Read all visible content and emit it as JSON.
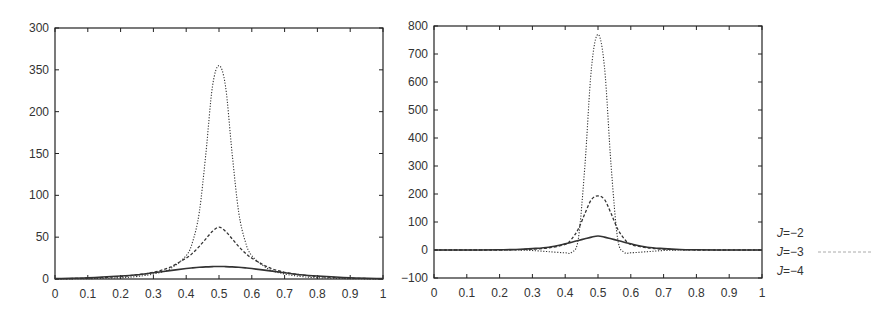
{
  "chart_data": [
    {
      "type": "line",
      "title": "",
      "xlabel": "",
      "ylabel": "",
      "xlim": [
        0,
        1
      ],
      "ylim": [
        0,
        300
      ],
      "grid": false,
      "x_ticks": [
        "0",
        "0.1",
        "0.2",
        "0.3",
        "0.4",
        "0.5",
        "0.6",
        "0.7",
        "0.8",
        "0.9",
        "1"
      ],
      "y_ticks": [
        "0",
        "50",
        "100",
        "150",
        "200",
        "350",
        "300"
      ],
      "x": [
        0,
        0.1,
        0.2,
        0.25,
        0.3,
        0.35,
        0.4,
        0.42,
        0.44,
        0.46,
        0.48,
        0.5,
        0.52,
        0.54,
        0.56,
        0.58,
        0.6,
        0.65,
        0.7,
        0.75,
        0.8,
        0.9,
        1
      ],
      "series": [
        {
          "name": "J=-2",
          "style": "solid",
          "values": [
            0.5,
            1.5,
            3.5,
            5,
            7.5,
            10,
            12.5,
            13.3,
            14,
            14.5,
            14.8,
            15,
            14.8,
            14.5,
            14,
            13.3,
            12.5,
            10,
            7.5,
            5,
            3.5,
            1.5,
            0.5
          ]
        },
        {
          "name": "J=-3",
          "style": "dashed",
          "values": [
            0.3,
            1,
            3,
            5,
            8,
            14,
            25,
            31,
            39,
            48,
            57,
            62,
            57,
            48,
            39,
            31,
            25,
            14,
            8,
            5,
            3,
            1,
            0.3
          ]
        },
        {
          "name": "J=-4",
          "style": "dotted",
          "values": [
            0.1,
            0.4,
            1.5,
            3,
            6,
            12,
            28,
            45,
            80,
            150,
            230,
            255,
            230,
            150,
            80,
            45,
            28,
            12,
            6,
            3,
            1.5,
            0.4,
            0.1
          ]
        }
      ]
    },
    {
      "type": "line",
      "title": "",
      "xlabel": "",
      "ylabel": "",
      "xlim": [
        0,
        1
      ],
      "ylim": [
        -100,
        800
      ],
      "grid": false,
      "x_ticks": [
        "0",
        "0.1",
        "0.2",
        "0.3",
        "0.4",
        "0.5",
        "0.6",
        "0.7",
        "0.8",
        "0.9",
        "1"
      ],
      "y_ticks": [
        "-100",
        "0",
        "100",
        "200",
        "300",
        "400",
        "500",
        "600",
        "700",
        "800"
      ],
      "x": [
        0,
        0.1,
        0.2,
        0.25,
        0.3,
        0.35,
        0.4,
        0.42,
        0.44,
        0.46,
        0.48,
        0.5,
        0.52,
        0.54,
        0.56,
        0.58,
        0.6,
        0.65,
        0.7,
        0.75,
        0.8,
        0.9,
        1
      ],
      "series": [
        {
          "name": "J=-2",
          "style": "solid",
          "values": [
            0,
            0,
            1,
            2,
            5,
            10,
            22,
            28,
            34,
            40,
            46,
            50,
            46,
            40,
            34,
            28,
            22,
            10,
            5,
            2,
            1,
            0,
            0
          ]
        },
        {
          "name": "J=-3",
          "style": "dashed",
          "values": [
            0,
            0,
            0,
            1,
            3,
            8,
            20,
            40,
            75,
            130,
            180,
            193,
            180,
            130,
            75,
            40,
            20,
            8,
            3,
            1,
            0,
            0,
            0
          ]
        },
        {
          "name": "J=-4",
          "style": "dotted",
          "values": [
            0,
            0,
            0,
            0,
            -2,
            -6,
            -10,
            -8,
            40,
            300,
            650,
            770,
            650,
            300,
            40,
            -8,
            -10,
            -6,
            -2,
            0,
            0,
            0,
            0
          ]
        }
      ]
    }
  ],
  "legend": {
    "items": [
      {
        "label": "J=−2",
        "style": "solid"
      },
      {
        "label": "J=−3",
        "style": "dashed"
      },
      {
        "label": "J=−4",
        "style": "dotted"
      }
    ]
  },
  "colors": {
    "line": "#333333",
    "axis": "#222222"
  }
}
